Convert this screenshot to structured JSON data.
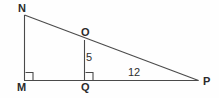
{
  "figure": {
    "kind": "geometry-diagram",
    "stroke_color": "#4a4a4a",
    "label_color": "#2b2b2b",
    "background_color": "#fefefe"
  },
  "vertices": [
    {
      "id": "N",
      "label": "N",
      "x": 24,
      "y": 15
    },
    {
      "id": "M",
      "label": "M",
      "x": 24,
      "y": 80
    },
    {
      "id": "P",
      "label": "P",
      "x": 198,
      "y": 80
    },
    {
      "id": "O",
      "label": "O",
      "x": 84,
      "y": 40
    },
    {
      "id": "Q",
      "label": "Q",
      "x": 84,
      "y": 80
    }
  ],
  "segments": [
    {
      "name": "MN",
      "from": "M",
      "to": "N"
    },
    {
      "name": "NP",
      "from": "N",
      "to": "P"
    },
    {
      "name": "MP",
      "from": "M",
      "to": "P"
    },
    {
      "name": "OQ",
      "from": "O",
      "to": "Q"
    }
  ],
  "right_angles": [
    {
      "at": "M",
      "label": "right-angle-marker-m"
    },
    {
      "at": "Q",
      "label": "right-angle-marker-q"
    }
  ],
  "measures": [
    {
      "id": "oq",
      "segment": "OQ",
      "value": "5"
    },
    {
      "id": "qp",
      "segment": "QP",
      "value": "12"
    }
  ]
}
